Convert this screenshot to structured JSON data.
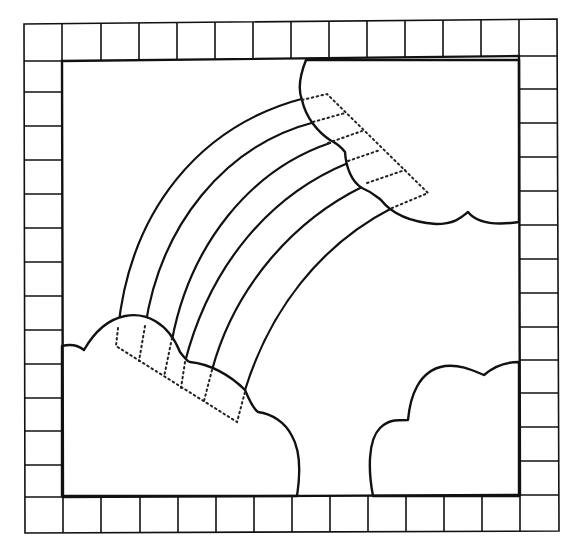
{
  "figure": {
    "colors": {
      "line": "#111111",
      "background": "#ffffff"
    }
  },
  "border": {
    "squares_per_side": 14,
    "outer_box": {
      "x1": 24,
      "y1": 22,
      "x2": 557,
      "y2": 531
    },
    "inner_box": {
      "x1": 62,
      "y1": 60,
      "x2": 519,
      "y2": 496
    }
  },
  "rainbow": {
    "band_lines": 6,
    "bands": 5
  },
  "clouds": [
    {
      "name": "upper-right-cloud"
    },
    {
      "name": "lower-left-cloud"
    },
    {
      "name": "lower-right-cloud"
    }
  ],
  "dotted_guides": [
    {
      "name": "upper-rainbow-end-seam-guide"
    },
    {
      "name": "lower-rainbow-end-seam-guide"
    }
  ]
}
